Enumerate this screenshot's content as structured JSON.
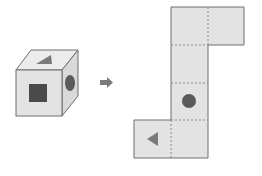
{
  "diagram": {
    "type": "cube-net-puzzle",
    "colors": {
      "background": "#ffffff",
      "face_fill": "#e3e3e3",
      "face_fill_top": "#ececec",
      "face_fill_side": "#d9d9d9",
      "outline": "#6e6e6e",
      "symbol": "#5a5a5a",
      "symbol_dark": "#4a4a4a",
      "arrow": "#7a7a7a",
      "dotted": "#8a8a8a"
    },
    "cube": {
      "faces": {
        "front": {
          "symbol": "square"
        },
        "top": {
          "symbol": "triangle"
        },
        "right": {
          "symbol": "circle"
        }
      }
    },
    "arrow": {
      "direction": "right"
    },
    "net": {
      "cells": [
        {
          "row": 0,
          "col": 1,
          "symbol": "none"
        },
        {
          "row": 0,
          "col": 2,
          "symbol": "none"
        },
        {
          "row": 1,
          "col": 1,
          "symbol": "none"
        },
        {
          "row": 2,
          "col": 1,
          "symbol": "circle"
        },
        {
          "row": 3,
          "col": 0,
          "symbol": "triangle-left"
        },
        {
          "row": 3,
          "col": 1,
          "symbol": "none"
        }
      ]
    }
  }
}
